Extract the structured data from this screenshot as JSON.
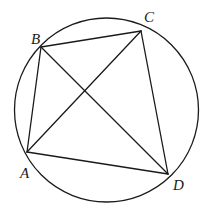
{
  "figure": {
    "circle": {
      "cx": 106.5,
      "cy": 110,
      "r": 92
    },
    "points": {
      "A": {
        "x": 27,
        "y": 152,
        "label": "A",
        "lx": 20,
        "ly": 178
      },
      "B": {
        "x": 41,
        "y": 47,
        "label": "B",
        "lx": 31,
        "ly": 44
      },
      "C": {
        "x": 141,
        "y": 31,
        "label": "C",
        "lx": 144,
        "ly": 22
      },
      "D": {
        "x": 168,
        "y": 174,
        "label": "D",
        "lx": 173,
        "ly": 190
      }
    },
    "segments": [
      [
        "A",
        "B"
      ],
      [
        "B",
        "C"
      ],
      [
        "C",
        "D"
      ],
      [
        "D",
        "A"
      ],
      [
        "A",
        "C"
      ],
      [
        "B",
        "D"
      ]
    ],
    "stroke_color": "#1a1a1a"
  }
}
